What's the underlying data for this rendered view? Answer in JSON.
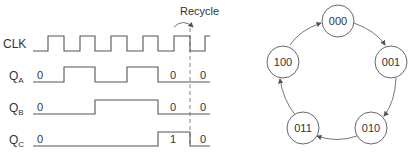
{
  "timing_diagram": {
    "annotation": "Recycle",
    "signals": [
      {
        "name": "CLK",
        "label_main": "CLK",
        "label_sub": ""
      },
      {
        "name": "QA",
        "label_main": "Q",
        "label_sub": "A",
        "values": [
          "0",
          "0",
          "0"
        ]
      },
      {
        "name": "QB",
        "label_main": "Q",
        "label_sub": "B",
        "values": [
          "0",
          "0",
          "0"
        ]
      },
      {
        "name": "QC",
        "label_main": "Q",
        "label_sub": "C",
        "values": [
          "0",
          "1",
          "0"
        ]
      }
    ]
  },
  "state_diagram": {
    "states": [
      "000",
      "001",
      "010",
      "011",
      "100"
    ],
    "transitions": [
      [
        "000",
        "001"
      ],
      [
        "001",
        "010"
      ],
      [
        "010",
        "011"
      ],
      [
        "011",
        "100"
      ],
      [
        "100",
        "000"
      ]
    ]
  }
}
